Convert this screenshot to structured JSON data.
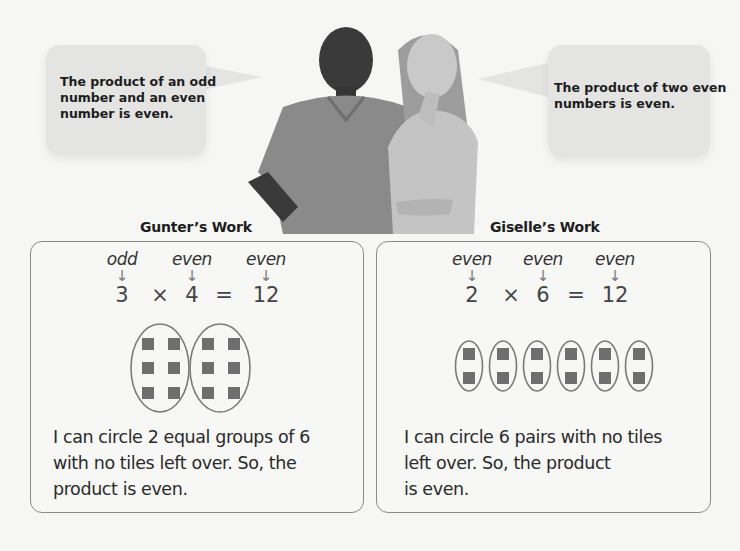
{
  "bubbles": {
    "left": {
      "speaker": "Gunter",
      "lines": [
        "The product of an odd",
        "number and an even",
        "number is even."
      ]
    },
    "right": {
      "speaker": "Giselle",
      "lines": [
        "The product of two even",
        "numbers is even."
      ]
    }
  },
  "photo": {
    "description": "two students thinking"
  },
  "gunter": {
    "title": "Gunter’s Work",
    "labels": [
      "odd",
      "even",
      "even"
    ],
    "arrow": "↓",
    "equation": {
      "a": "3",
      "op": "×",
      "b": "4",
      "eq": "=",
      "result": "12"
    },
    "model": {
      "groups": 2,
      "tiles_per_group": 6
    },
    "explanation": [
      "I can circle 2 equal groups of 6",
      "with no tiles left over. So, the",
      "product is even."
    ]
  },
  "giselle": {
    "title": "Giselle’s Work",
    "labels": [
      "even",
      "even",
      "even"
    ],
    "arrow": "↓",
    "equation": {
      "a": "2",
      "op": "×",
      "b": "6",
      "eq": "=",
      "result": "12"
    },
    "model": {
      "groups": 6,
      "tiles_per_group": 2
    },
    "explanation": [
      "I can circle 6 pairs with no tiles",
      "left over. So, the product",
      "is even."
    ]
  },
  "colors": {
    "background": "#f6f6f5",
    "bubble": "#e4e4e3",
    "tile": "#6e6e6e",
    "outline": "#8a8a8a"
  }
}
